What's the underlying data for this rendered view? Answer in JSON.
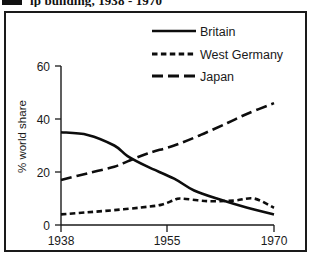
{
  "title": {
    "bullet_icon": "black-square-bullet",
    "text": "ip building, 1938 - 1970"
  },
  "chart_data": {
    "type": "line",
    "title": "ip building, 1938 - 1970",
    "xlabel": "",
    "ylabel": "% world share",
    "xlim": [
      1938,
      1970
    ],
    "ylim": [
      0,
      60
    ],
    "xticks": [
      "1938",
      "1955",
      "1970"
    ],
    "yticks": [
      "0",
      "20",
      "40",
      "60"
    ],
    "grid": false,
    "legend_position": "top-right",
    "series": [
      {
        "name": "Britain",
        "style": "solid",
        "x": [
          1938,
          1942,
          1946,
          1948,
          1951,
          1955,
          1958,
          1962,
          1966,
          1970
        ],
        "values": [
          35,
          34,
          30,
          26,
          22,
          17.5,
          13,
          9.5,
          6.5,
          4
        ]
      },
      {
        "name": "West Germany",
        "style": "short-dash",
        "x": [
          1938,
          1942,
          1946,
          1950,
          1953,
          1955,
          1956,
          1960,
          1964,
          1967,
          1970
        ],
        "values": [
          4,
          4.8,
          5.6,
          6.6,
          7.6,
          9.4,
          10,
          9,
          9.2,
          10,
          6.5
        ]
      },
      {
        "name": "Japan",
        "style": "long-dash",
        "x": [
          1938,
          1942,
          1946,
          1948,
          1951,
          1955,
          1959,
          1963,
          1966,
          1970
        ],
        "values": [
          17,
          19.5,
          22,
          24,
          27,
          30,
          34,
          38.5,
          42,
          46
        ]
      }
    ]
  },
  "legend": {
    "items": [
      {
        "label": "Britain",
        "style": "solid"
      },
      {
        "label": "West Germany",
        "style": "short-dash"
      },
      {
        "label": "Japan",
        "style": "long-dash"
      }
    ]
  },
  "axes": {
    "y_title": "% world share",
    "y_ticks": [
      {
        "label": "60",
        "value": 60
      },
      {
        "label": "40",
        "value": 40
      },
      {
        "label": "20",
        "value": 20
      },
      {
        "label": "0",
        "value": 0
      }
    ],
    "x_ticks": [
      {
        "label": "1938",
        "value": 1938
      },
      {
        "label": "1955",
        "value": 1955
      },
      {
        "label": "1970",
        "value": 1970
      }
    ]
  },
  "colors": {
    "ink": "#0d0d0d",
    "frame": "#1a1a1a",
    "background": "#ffffff"
  }
}
